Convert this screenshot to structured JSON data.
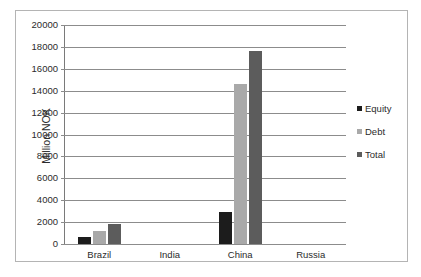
{
  "chart_data": {
    "type": "bar",
    "title": "",
    "xlabel": "",
    "ylabel": "Million NOK",
    "ylim": [
      0,
      20000
    ],
    "ytick_labels": [
      "20000",
      "18000",
      "16000",
      "14000",
      "12000",
      "10000",
      "8000",
      "6000",
      "4000",
      "2000",
      "0"
    ],
    "yticks": [
      20000,
      18000,
      16000,
      14000,
      12000,
      10000,
      8000,
      6000,
      4000,
      2000,
      0
    ],
    "grid": true,
    "legend_position": "right",
    "categories": [
      "Brazil",
      "India",
      "China",
      "Russia"
    ],
    "series": [
      {
        "name": "Equity",
        "color": "#1c1c1c",
        "values": [
          650,
          0,
          2950,
          0
        ]
      },
      {
        "name": "Debt",
        "color": "#a9a9a9",
        "values": [
          1150,
          0,
          14650,
          0
        ]
      },
      {
        "name": "Total",
        "color": "#5c5c5c",
        "values": [
          1800,
          0,
          17650,
          0
        ]
      }
    ]
  },
  "legend": {
    "items": [
      {
        "label": "Equity",
        "swatch": "equity"
      },
      {
        "label": "Debt",
        "swatch": "debt"
      },
      {
        "label": "Total",
        "swatch": "total"
      }
    ]
  }
}
